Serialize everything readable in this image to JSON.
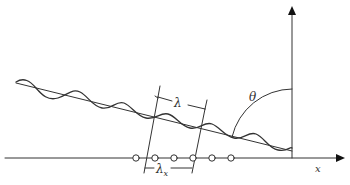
{
  "diagram": {
    "labels": {
      "wavelength": "λ",
      "projected_wavelength": "λ",
      "projected_wavelength_subscript": "x",
      "angle": "θ",
      "x_axis": "x"
    },
    "elements": {
      "array_element_count": 6
    },
    "colors": {
      "stroke": "#333333",
      "background": "#ffffff"
    }
  }
}
